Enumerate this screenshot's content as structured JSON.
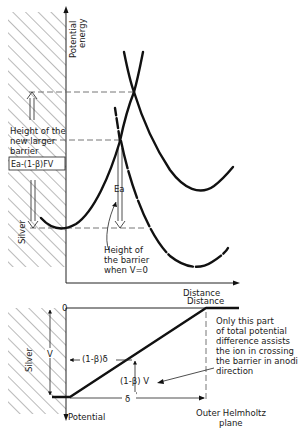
{
  "top_diagram": {
    "y_axis_label_line1": "Potential",
    "y_axis_label_line2": "energy",
    "x_axis_label": "Distance",
    "electrode_label": "Silver",
    "new_barrier_label_line1": "Height of the",
    "new_barrier_label_line2": "new larger",
    "new_barrier_label_line3": "barrier",
    "new_barrier_formula": "Ea-(1-β)FV",
    "activation_label": "Ea",
    "barrier_v0_label_line1": "Height of",
    "barrier_v0_label_line2": "the barrier",
    "barrier_v0_label_line3": "when  V=0"
  },
  "bottom_diagram": {
    "zero_label": "0",
    "x_axis_label": "Distance",
    "y_axis_label": "Potential",
    "electrode_label": "Silver",
    "v_label": "V",
    "fraction_distance_label": "(1-β)δ",
    "fraction_potential_label": "(1-β) V",
    "delta_label": "δ",
    "note_lines": [
      "Only this part",
      "of total potential",
      "difference assists",
      "the ion in crossing",
      "the barrier in anodic",
      "direction"
    ],
    "plane_label_line1": "Outer Helmholtz",
    "plane_label_line2": "plane"
  },
  "colors": {
    "ink": "#111111",
    "hatch": "#555555",
    "background": "#ffffff"
  }
}
